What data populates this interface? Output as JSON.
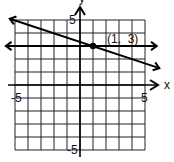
{
  "chart_data": {
    "type": "line",
    "title": "",
    "xlabel": "x",
    "ylabel": "y",
    "xlim": [
      -5,
      5
    ],
    "ylim": [
      -5,
      5
    ],
    "grid": true,
    "tick_labels": {
      "x_neg": "-5",
      "x_pos": "5",
      "y_pos": "5",
      "y_neg": "-5"
    },
    "series": [
      {
        "name": "horizontal line y = 3",
        "equation": "y = 3",
        "points": [
          [
            -5.7,
            3
          ],
          [
            5.9,
            3
          ]
        ],
        "arrows": "both"
      },
      {
        "name": "sloped line through (1, 3)",
        "equation": "y = -x/3 + 10/3",
        "points": [
          [
            -5.4,
            5.1
          ],
          [
            6.1,
            1.3
          ]
        ],
        "arrows": "both"
      }
    ],
    "annotations": [
      {
        "text": "(1,  3)",
        "point": [
          1,
          3
        ],
        "marker": "filled-dot"
      }
    ]
  }
}
